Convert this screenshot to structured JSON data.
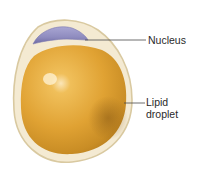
{
  "diagram": {
    "labels": [
      {
        "id": "nucleus",
        "text": "Nucleus"
      },
      {
        "id": "lipid_droplet",
        "text": "Lipid\ndroplet"
      }
    ],
    "colors": {
      "cell_membrane": "#d9c9a0",
      "cytoplasm": "#f4ead2",
      "lipid_droplet": "#e0a233",
      "lipid_droplet_shadow": "#b37a1c",
      "lipid_highlight": "#fbe6b8",
      "nucleus": "#8f8cbf",
      "nucleus_dark": "#6e6aa3",
      "leader_line": "#4a4a4a",
      "label_text": "#2a2a2a"
    }
  }
}
